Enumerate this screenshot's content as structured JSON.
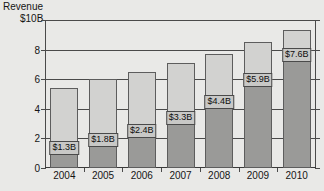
{
  "axis": {
    "y_title_line1": "Revenue",
    "y_title_line2": "$10B",
    "y_ticks": [
      "0",
      "2",
      "4",
      "6",
      "8"
    ],
    "y_top_tick": "$10B"
  },
  "chart_data": {
    "type": "bar",
    "title": "Revenue",
    "xlabel": "",
    "ylabel": "Revenue",
    "ylim": [
      0,
      10
    ],
    "grid": true,
    "legend": "none",
    "categories": [
      "2004",
      "2005",
      "2006",
      "2007",
      "2008",
      "2009",
      "2010"
    ],
    "series": [
      {
        "name": "Highlighted revenue",
        "values": [
          1.3,
          1.8,
          2.4,
          3.3,
          4.4,
          5.9,
          7.6
        ],
        "labels": [
          "$1.3B",
          "$1.8B",
          "$2.4B",
          "$3.3B",
          "$4.4B",
          "$5.9B",
          "$7.6B"
        ]
      },
      {
        "name": "Total revenue",
        "values": [
          5.4,
          6.0,
          6.5,
          7.1,
          7.7,
          8.5,
          9.3
        ]
      }
    ]
  }
}
